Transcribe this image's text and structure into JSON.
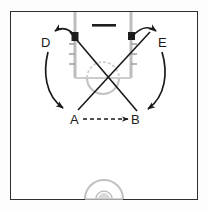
{
  "diagram": {
    "type": "basketball-play",
    "colors": {
      "frame": "#2e2f33",
      "court_line": "#b9b9b9",
      "movement_line": "#1a1a1a",
      "page_background": "#fdfdfd",
      "court_background": "#ffffff"
    },
    "court": {
      "name": "half-court",
      "backboard": {
        "label": "backboard"
      },
      "lane": {
        "label": "free-throw-lane"
      },
      "free_throw_circle": {
        "label": "free-throw-circle"
      },
      "center_circle": {
        "label": "center-circle"
      },
      "lane_blocks": 2,
      "lane_hash_marks": 6
    },
    "players": [
      {
        "id": "D",
        "label": "D",
        "role": "left-wing-screener"
      },
      {
        "id": "E",
        "label": "E",
        "role": "right-wing-screener"
      },
      {
        "id": "A",
        "label": "A",
        "role": "left-guard-passer"
      },
      {
        "id": "B",
        "label": "B",
        "role": "right-guard-receiver"
      }
    ],
    "movements": [
      {
        "from": "lane-left-block",
        "to": "D",
        "style": "solid-curve",
        "label": "cut-to-D"
      },
      {
        "from": "D",
        "to": "left-corner",
        "style": "solid-curve",
        "label": "D-down-cut"
      },
      {
        "from": "lane-right-block",
        "to": "E",
        "style": "solid-curve",
        "label": "cut-to-E"
      },
      {
        "from": "E",
        "to": "right-corner",
        "style": "solid-curve",
        "label": "E-down-cut"
      },
      {
        "from": "A",
        "to": "right-high-post",
        "style": "solid-line",
        "label": "A-cross-cut"
      },
      {
        "from": "B",
        "to": "left-high-post",
        "style": "solid-line",
        "label": "B-cross-cut"
      }
    ],
    "passes": [
      {
        "from": "A",
        "to": "B",
        "style": "dashed-arrow",
        "label": "pass-A-to-B"
      }
    ]
  }
}
